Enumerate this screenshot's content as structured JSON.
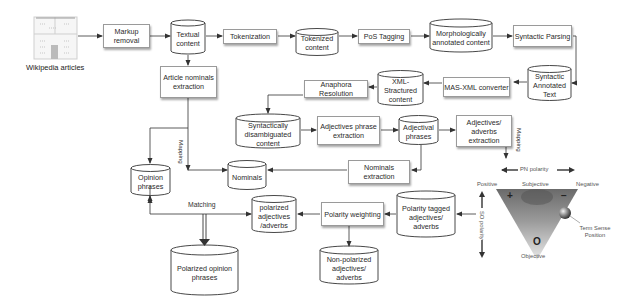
{
  "diagram": {
    "source": {
      "label": "Wikipedia articles",
      "icon": "documents-icon"
    },
    "nodes": {
      "markup_removal": "Markup removal",
      "textual_content": "Textual content",
      "tokenization": "Tokenization",
      "tokenized_content": "Tokenized content",
      "pos_tagging": "PoS Tagging",
      "morph_content": "Morphologically annotated content",
      "syntactic_parsing": "Syntactic Parsing",
      "syntactic_annotated_text": "Syntactic Annotated Text",
      "mas_xml_converter": "MAS-XML converter",
      "xml_structured_content": "XML-Stractured content",
      "anaphora_resolution": "Anaphora Resolution",
      "article_nominals_extraction": "Article nominals extraction",
      "syntactically_disambiguated": "Syntactically disambiguated content",
      "adjectives_phrase_extraction": "Adjectives phrase extraction",
      "adjectival_phrases": "Adjectival phrases",
      "adjectives_adverbs_extraction": "Adjectives/ adverbs extraction",
      "nominals_extraction": "Nominals extraction",
      "nominals": "Nominals",
      "opinion_phrases": "Opinion phrases",
      "polarized_adj_adv": "polarized adjectives /adverbs",
      "polarity_weighting": "Polarity weighting",
      "polarity_tagged": "Polarity tagged adjectives/ adverbs",
      "non_polarized": "Non-polarized adjectives/ adverbs",
      "polarized_opinion_phrases": "Polarized opinion phrases"
    },
    "edge_labels": {
      "mapping_left": "Mapping",
      "mapping_right": "Mapping",
      "matching": "Matching"
    },
    "triangle": {
      "pn_polarity": "PN polarity",
      "so_polarity": "SO polarity",
      "positive": "Positive",
      "subjective": "Subjective",
      "negative": "Negative",
      "objective": "Objective",
      "plus": "+",
      "minus": "−",
      "zero": "O",
      "term_sense_position": "Term Sense Position"
    }
  }
}
